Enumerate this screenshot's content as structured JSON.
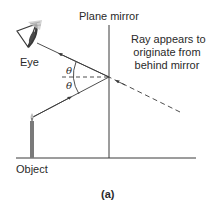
{
  "figure": {
    "caption": "(a)",
    "labels": {
      "mirror": "Plane mirror",
      "eye": "Eye",
      "object": "Object",
      "theta_incident": "θ",
      "theta_reflected": "θ",
      "note_line1": "Ray appears to",
      "note_line2": "originate from",
      "note_line3": "behind mirror"
    },
    "colors": {
      "line": "#3a3a3a",
      "text": "#2a2a2a",
      "candle": "#7a7a7a",
      "background": "#ffffff"
    }
  }
}
